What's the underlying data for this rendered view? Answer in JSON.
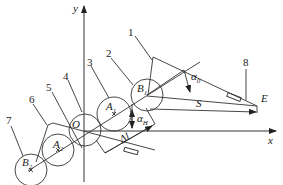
{
  "axes": {
    "x_label": "x",
    "y_label": "y"
  },
  "points": {
    "origin": "O",
    "A1": {
      "main": "A",
      "sub": "1"
    },
    "B1": {
      "main": "B",
      "sub": "1"
    },
    "A2": {
      "main": "A",
      "sub": "2"
    },
    "B2": {
      "main": "B",
      "sub": "2"
    },
    "E": "E"
  },
  "dimensions": {
    "S": "S",
    "delta_l": "Δl",
    "alpha_0": {
      "main": "α",
      "sub": "0"
    },
    "alpha_H": {
      "main": "α",
      "sub": "H"
    }
  },
  "callouts": [
    "1",
    "2",
    "3",
    "4",
    "5",
    "6",
    "7",
    "8"
  ],
  "colors": {
    "line": "#333333",
    "background": "#ffffff"
  }
}
